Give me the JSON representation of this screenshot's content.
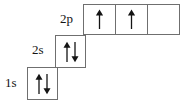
{
  "diagram": {
    "type": "orbital-filling-diagram",
    "element_hint": "",
    "colors": {
      "box_border": "#6f6f6f",
      "box_fill": "#ffffff",
      "arrow": "#141414",
      "label_text": "#141414",
      "background": "#ffffff"
    },
    "rows": [
      {
        "id": "2p",
        "label": "2p",
        "orbitals": [
          {
            "spins": [
              "up"
            ]
          },
          {
            "spins": [
              "up"
            ]
          },
          {
            "spins": []
          }
        ]
      },
      {
        "id": "2s",
        "label": "2s",
        "orbitals": [
          {
            "spins": [
              "up",
              "down"
            ]
          }
        ]
      },
      {
        "id": "1s",
        "label": "1s",
        "orbitals": [
          {
            "spins": [
              "up",
              "down"
            ]
          }
        ]
      }
    ]
  }
}
